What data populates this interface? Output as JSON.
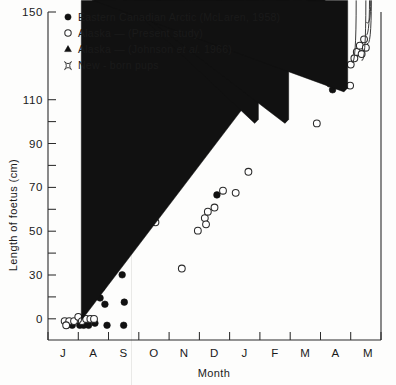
{
  "figure": {
    "caption_present": false,
    "background_color": "#fdfdfc",
    "ink_color": "#1a1a1a"
  },
  "chart_data": {
    "type": "scatter",
    "title": "",
    "xlabel": "Month",
    "ylabel": "Length of foetus (cm)",
    "xlim": [
      0,
      11
    ],
    "ylim": [
      -6,
      150
    ],
    "grid": false,
    "legend_position": "top-left",
    "x_tick_labels": [
      "J",
      "A",
      "S",
      "O",
      "N",
      "D",
      "J",
      "F",
      "M",
      "A",
      "M"
    ],
    "x_tick_positions": [
      0.5,
      1.5,
      2.5,
      3.5,
      4.5,
      5.5,
      6.5,
      7.5,
      8.5,
      9.5,
      10.5
    ],
    "y_tick_labels": [
      "0",
      "30",
      "50",
      "70",
      "90",
      "110",
      "150"
    ],
    "y_tick_values": [
      0,
      30,
      50,
      70,
      90,
      110,
      150
    ],
    "y_minor_ticks": [
      10,
      20,
      40,
      60,
      80,
      100,
      120,
      130,
      140
    ],
    "series": [
      {
        "name": "Eastern Canadian Arctic (McLaren, 1958)",
        "marker": "filled-circle",
        "color": "#111111",
        "points": [
          {
            "x": 0.62,
            "y": 1
          },
          {
            "x": 0.8,
            "y": 1
          },
          {
            "x": 1.05,
            "y": 1
          },
          {
            "x": 1.18,
            "y": 1
          },
          {
            "x": 1.34,
            "y": 1
          },
          {
            "x": 1.55,
            "y": 2
          },
          {
            "x": 1.95,
            "y": 1
          },
          {
            "x": 1.72,
            "y": 14
          },
          {
            "x": 1.88,
            "y": 11
          },
          {
            "x": 1.78,
            "y": 19
          },
          {
            "x": 2.5,
            "y": 1
          },
          {
            "x": 2.52,
            "y": 12
          },
          {
            "x": 2.45,
            "y": 25
          },
          {
            "x": 5.58,
            "y": 63
          },
          {
            "x": 9.4,
            "y": 113
          }
        ]
      },
      {
        "name": "Alaska — (Present study)",
        "marker": "open-circle",
        "color": "#2a2a2a",
        "points": [
          {
            "x": 0.55,
            "y": 3
          },
          {
            "x": 0.7,
            "y": 3
          },
          {
            "x": 0.86,
            "y": 3
          },
          {
            "x": 1.0,
            "y": 5
          },
          {
            "x": 1.12,
            "y": 3
          },
          {
            "x": 1.26,
            "y": 4
          },
          {
            "x": 1.4,
            "y": 4
          },
          {
            "x": 1.52,
            "y": 4
          },
          {
            "x": 0.6,
            "y": 1
          },
          {
            "x": 3.55,
            "y": 50
          },
          {
            "x": 4.42,
            "y": 28
          },
          {
            "x": 4.95,
            "y": 46
          },
          {
            "x": 5.18,
            "y": 52
          },
          {
            "x": 5.28,
            "y": 55
          },
          {
            "x": 5.22,
            "y": 49
          },
          {
            "x": 5.5,
            "y": 57
          },
          {
            "x": 5.78,
            "y": 65
          },
          {
            "x": 6.2,
            "y": 64
          },
          {
            "x": 6.62,
            "y": 74
          },
          {
            "x": 8.88,
            "y": 97
          },
          {
            "x": 9.32,
            "y": 116
          },
          {
            "x": 9.52,
            "y": 116
          },
          {
            "x": 9.7,
            "y": 118
          },
          {
            "x": 9.98,
            "y": 115
          },
          {
            "x": 10.0,
            "y": 125
          },
          {
            "x": 10.12,
            "y": 128
          },
          {
            "x": 10.2,
            "y": 131
          },
          {
            "x": 10.3,
            "y": 134
          },
          {
            "x": 10.36,
            "y": 130
          },
          {
            "x": 10.44,
            "y": 137
          },
          {
            "x": 10.5,
            "y": 133
          }
        ]
      },
      {
        "name": "Alaska — (Johnson et al. 1966)",
        "marker": "filled-triangle",
        "color": "#111111",
        "points": [
          {
            "x": 1.1,
            "y": 1
          },
          {
            "x": 6.95,
            "y": 97
          },
          {
            "x": 7.95,
            "y": 97
          },
          {
            "x": 9.9,
            "y": 112
          }
        ]
      },
      {
        "name": "New - born pups",
        "marker": "four-point-star",
        "color": "#3a3a3a",
        "points": [
          {
            "x": 10.18,
            "y": 124
          },
          {
            "x": 10.5,
            "y": 125
          },
          {
            "x": 10.62,
            "y": 137
          },
          {
            "x": 10.68,
            "y": 133
          },
          {
            "x": 10.66,
            "y": 143
          }
        ]
      }
    ]
  },
  "legend": {
    "entries": [
      {
        "marker": "filled-circle",
        "label": "Eastern Canadian Arctic  (McLaren, 1958)"
      },
      {
        "marker": "open-circle",
        "label": "Alaska — (Present  study)"
      },
      {
        "marker": "filled-triangle",
        "label_pre": "Alaska — (Johnson ",
        "label_ital": "et al.",
        "label_post": " 1966)"
      },
      {
        "marker": "four-point-star",
        "label": "New - born  pups"
      }
    ]
  }
}
